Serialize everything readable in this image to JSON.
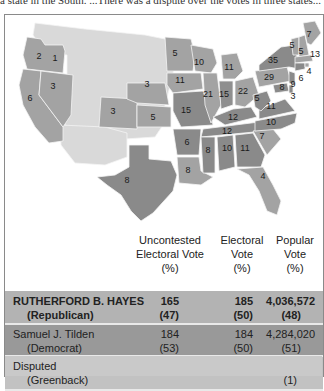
{
  "page": {
    "top_text": "a state in the South. ...There was a dispute over the votes in three states..."
  },
  "map": {
    "colors": {
      "republican": "#a9a9a9",
      "democrat": "#8c8c8c",
      "territory": "#d9d9d9",
      "disputed": "#c4c4c4",
      "border": "#f4f4f4"
    },
    "states": [
      {
        "id": "OR",
        "votes": "2"
      },
      {
        "id": "ID-area",
        "votes": "1"
      },
      {
        "id": "CA",
        "votes": "6"
      },
      {
        "id": "NV",
        "votes": "3"
      },
      {
        "id": "CO",
        "votes": "3"
      },
      {
        "id": "NE",
        "votes": "3"
      },
      {
        "id": "KS",
        "votes": "5"
      },
      {
        "id": "TX",
        "votes": "8"
      },
      {
        "id": "MN",
        "votes": "5"
      },
      {
        "id": "IA",
        "votes": "11"
      },
      {
        "id": "MO",
        "votes": "15"
      },
      {
        "id": "AR",
        "votes": "6"
      },
      {
        "id": "LA",
        "votes": "8"
      },
      {
        "id": "WI",
        "votes": "10"
      },
      {
        "id": "IL",
        "votes": "21"
      },
      {
        "id": "MI",
        "votes": "11"
      },
      {
        "id": "IN",
        "votes": "15"
      },
      {
        "id": "OH",
        "votes": "22"
      },
      {
        "id": "KY",
        "votes": "12"
      },
      {
        "id": "TN",
        "votes": "12"
      },
      {
        "id": "MS",
        "votes": "8"
      },
      {
        "id": "AL",
        "votes": "10"
      },
      {
        "id": "GA",
        "votes": "11"
      },
      {
        "id": "FL",
        "votes": "4"
      },
      {
        "id": "SC",
        "votes": "7"
      },
      {
        "id": "NC",
        "votes": "10"
      },
      {
        "id": "VA",
        "votes": "11"
      },
      {
        "id": "WV",
        "votes": "5"
      },
      {
        "id": "PA",
        "votes": "29"
      },
      {
        "id": "NY",
        "votes": "35"
      },
      {
        "id": "VT",
        "votes": "5"
      },
      {
        "id": "NH",
        "votes": "5"
      },
      {
        "id": "ME",
        "votes": "7"
      },
      {
        "id": "MA",
        "votes": "13"
      },
      {
        "id": "RI",
        "votes": "4"
      },
      {
        "id": "CT",
        "votes": "6"
      },
      {
        "id": "NJ",
        "votes": "9"
      },
      {
        "id": "MD",
        "votes": "8"
      },
      {
        "id": "DE",
        "votes": "3"
      }
    ]
  },
  "table": {
    "headers": {
      "uncontested": [
        "Uncontested",
        "Electoral Vote",
        "(%)"
      ],
      "electoral": [
        "Electoral",
        "Vote",
        "(%)"
      ],
      "popular": [
        "Popular",
        "Vote",
        "(%)"
      ]
    },
    "rows": [
      {
        "name": "RUTHERFORD B. HAYES",
        "party": "(Republican)",
        "uncontested": "165",
        "uncontested_pct": "(47)",
        "electoral": "185",
        "electoral_pct": "(50)",
        "popular": "4,036,572",
        "popular_pct": "(48)",
        "color": "#b3b3b3"
      },
      {
        "name": "Samuel J. Tilden",
        "party": "(Democrat)",
        "uncontested": "184",
        "uncontested_pct": "(53)",
        "electoral": "184",
        "electoral_pct": "(50)",
        "popular": "4,284,020",
        "popular_pct": "(51)",
        "color": "#999999"
      },
      {
        "name": "Peter Cooper",
        "party": "(Greenback)",
        "uncontested": "–",
        "uncontested_pct": "",
        "electoral": "–",
        "electoral_pct": "",
        "popular": "81,737",
        "popular_pct": "(1)",
        "color": "#c2c2c2"
      },
      {
        "name": "Disputed",
        "party": "",
        "color": "#c9c9c9"
      }
    ]
  }
}
